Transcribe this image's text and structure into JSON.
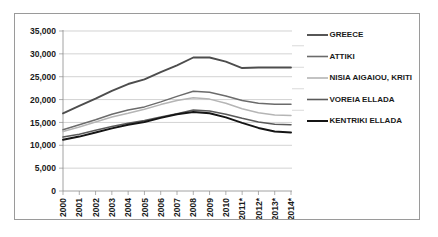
{
  "chart_data": {
    "type": "line",
    "title": "",
    "xlabel": "",
    "ylabel": "",
    "ylim": [
      0,
      35000
    ],
    "ytick_step": 5000,
    "yticks": [
      "0",
      "5,000",
      "10,000",
      "15,000",
      "20,000",
      "25,000",
      "30,000",
      "35,000"
    ],
    "ytick_values": [
      0,
      5000,
      10000,
      15000,
      20000,
      25000,
      30000,
      35000
    ],
    "grid": "horizontal",
    "legend_position": "right",
    "categories": [
      "2000",
      "2001",
      "2002",
      "2003",
      "2004",
      "2005",
      "2006",
      "2007",
      "2008",
      "2009",
      "2010",
      "2011*",
      "2012*",
      "2013*",
      "2014*"
    ],
    "series": [
      {
        "name": "GREECE",
        "color": "#4d4d4d",
        "width": 1.9,
        "values": [
          17000,
          18600,
          20200,
          21900,
          23400,
          24400,
          26000,
          27500,
          29200,
          29200,
          28300,
          26900,
          27000,
          27000,
          27000
        ]
      },
      {
        "name": "ATTIKI",
        "color": "#6b6b6b",
        "width": 1.5,
        "values": [
          13400,
          14500,
          15600,
          16800,
          17700,
          18400,
          19500,
          20700,
          21800,
          21600,
          20800,
          19800,
          19200,
          19000,
          19000
        ]
      },
      {
        "name": "NISIA AIGAIOU, KRITI",
        "color": "#b5b5b5",
        "width": 1.5,
        "values": [
          13000,
          14000,
          15100,
          16200,
          17000,
          17900,
          18900,
          19800,
          20400,
          20100,
          19200,
          18000,
          17100,
          16600,
          16500
        ]
      },
      {
        "name": "VOREIA ELLADA",
        "color": "#5a5a5a",
        "width": 1.6,
        "values": [
          11800,
          12400,
          13300,
          14100,
          14800,
          15400,
          16200,
          16900,
          17700,
          17500,
          16800,
          15900,
          15100,
          14600,
          14500
        ]
      },
      {
        "name": "KENTRIKI ELLADA",
        "color": "#151515",
        "width": 2.0,
        "values": [
          11200,
          11900,
          12800,
          13700,
          14500,
          15100,
          16000,
          16800,
          17300,
          17000,
          16100,
          14900,
          13800,
          13000,
          12800
        ]
      }
    ]
  },
  "legend": {
    "items": [
      {
        "label": "GREECE"
      },
      {
        "label": "ATTIKI"
      },
      {
        "label": "NISIA AIGAIOU, KRITI"
      },
      {
        "label": "VOREIA ELLADA"
      },
      {
        "label": "KENTRIKI ELLADA"
      }
    ]
  }
}
